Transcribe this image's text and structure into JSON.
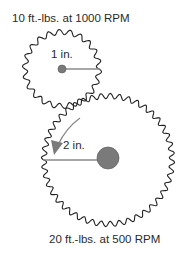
{
  "diagram": {
    "small_gear": {
      "torque_label": "10 ft.-lbs. at 1000 RPM",
      "radius_label": "1 in.",
      "teeth": 22
    },
    "large_gear": {
      "torque_label": "20 ft.-lbs. at 500 RPM",
      "radius_label": "2 in.",
      "teeth": 44
    },
    "colors": {
      "gear_outline": "#222222",
      "hub": "#7a7a7a",
      "radius_line": "#8a8a8a",
      "arrow": "#7a7a7a"
    }
  }
}
